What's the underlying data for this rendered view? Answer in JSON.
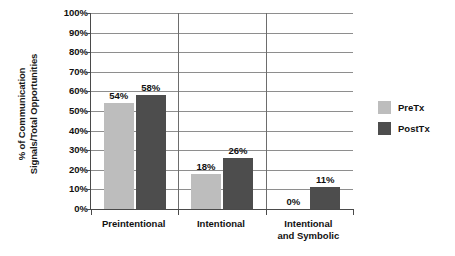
{
  "chart_data": {
    "type": "bar",
    "title": "",
    "xlabel": "",
    "ylabel_line1": "% of Communication",
    "ylabel_line2": "Signals/Total Opportunities",
    "categories": [
      "Preintentional",
      "Intentional",
      "Intentional and Symbolic"
    ],
    "category_lines": [
      [
        "Preintentional"
      ],
      [
        "Intentional"
      ],
      [
        "Intentional",
        "and Symbolic"
      ]
    ],
    "series": [
      {
        "name": "PreTx",
        "color": "#bdbdbd",
        "values": [
          54,
          18,
          0
        ],
        "labels": [
          "54%",
          "18%",
          "0%"
        ]
      },
      {
        "name": "PostTx",
        "color": "#4d4d4d",
        "values": [
          58,
          26,
          11
        ],
        "labels": [
          "58%",
          "26%",
          "11%"
        ]
      }
    ],
    "ylim": [
      0,
      100
    ],
    "ytick_values": [
      0,
      10,
      20,
      30,
      40,
      50,
      60,
      70,
      80,
      90,
      100
    ],
    "ytick_labels": [
      "0%",
      "10%",
      "20%",
      "30%",
      "40%",
      "50%",
      "60%",
      "70%",
      "80%",
      "90%",
      "100%"
    ],
    "grid": true,
    "legend_position": "right",
    "value_labels_shown": true
  }
}
